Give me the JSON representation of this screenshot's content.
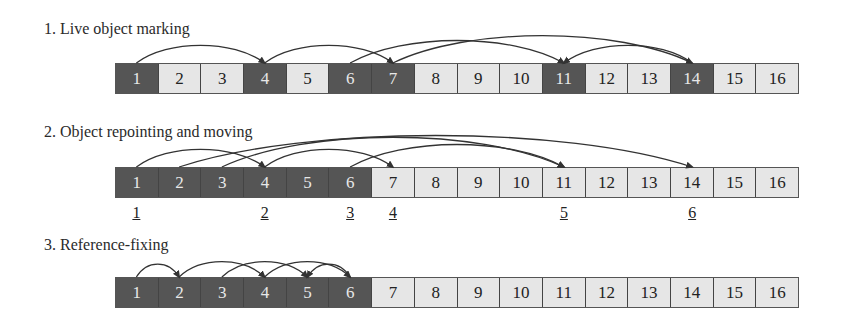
{
  "diagram": {
    "cell_count": 16,
    "colors": {
      "live": "#555555",
      "free": "#e6e6e6",
      "arrow": "#333333"
    },
    "phases": [
      {
        "title": "1. Live object marking",
        "cells": [
          "1",
          "2",
          "3",
          "4",
          "5",
          "6",
          "7",
          "8",
          "9",
          "10",
          "11",
          "12",
          "13",
          "14",
          "15",
          "16"
        ],
        "live": [
          1,
          4,
          6,
          7,
          11,
          14
        ],
        "arrows": [
          [
            1,
            4
          ],
          [
            4,
            7
          ],
          [
            6,
            11
          ],
          [
            7,
            14
          ],
          [
            14,
            11
          ]
        ]
      },
      {
        "title": "2. Object repointing and moving",
        "cells": [
          "1",
          "2",
          "3",
          "4",
          "5",
          "6",
          "7",
          "8",
          "9",
          "10",
          "11",
          "12",
          "13",
          "14",
          "15",
          "16"
        ],
        "live": [
          1,
          2,
          3,
          4,
          5,
          6
        ],
        "arrows": [
          [
            1,
            4
          ],
          [
            4,
            7
          ],
          [
            3,
            11
          ],
          [
            2,
            14
          ],
          [
            6,
            11
          ]
        ],
        "new_addresses": [
          {
            "label": "1",
            "under_cell": 1
          },
          {
            "label": "2",
            "under_cell": 4
          },
          {
            "label": "3",
            "under_cell": 6
          },
          {
            "label": "4",
            "under_cell": 7
          },
          {
            "label": "5",
            "under_cell": 11
          },
          {
            "label": "6",
            "under_cell": 14
          }
        ]
      },
      {
        "title": "3. Reference-fixing",
        "cells": [
          "1",
          "2",
          "3",
          "4",
          "5",
          "6",
          "7",
          "8",
          "9",
          "10",
          "11",
          "12",
          "13",
          "14",
          "15",
          "16"
        ],
        "live": [
          1,
          2,
          3,
          4,
          5,
          6
        ],
        "arrows": [
          [
            1,
            2
          ],
          [
            2,
            4
          ],
          [
            3,
            5
          ],
          [
            4,
            6
          ],
          [
            6,
            5
          ]
        ]
      }
    ]
  }
}
